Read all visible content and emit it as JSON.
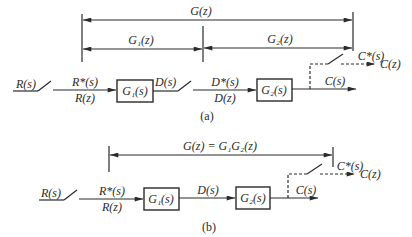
{
  "diagram_a": {
    "caption": "(a)",
    "span_total": "G(z)",
    "span_left": "G₁(z)",
    "span_right": "G₂(z)",
    "input": "R(s)",
    "sampled_input_top": "R*(s)",
    "sampled_input_bottom": "R(z)",
    "block1": "G₁(s)",
    "block1_output": "D(s)",
    "sampled_mid_top": "D*(s)",
    "sampled_mid_bottom": "D(z)",
    "block2": "G₂(s)",
    "output": "C(s)",
    "sampled_output": "C*(s)",
    "z_output": "C(z)"
  },
  "diagram_b": {
    "caption": "(b)",
    "span_total": "G(z) = G₁G₂(z)",
    "input": "R(s)",
    "sampled_input_top": "R*(s)",
    "sampled_input_bottom": "R(z)",
    "block1": "G₁(s)",
    "mid_signal": "D(s)",
    "block2": "G₂(s)",
    "output": "C(s)",
    "sampled_output": "C*(s)",
    "z_output": "C(z)"
  },
  "colors": {
    "ink": "#2a2a2a",
    "background": "#ffffff"
  }
}
